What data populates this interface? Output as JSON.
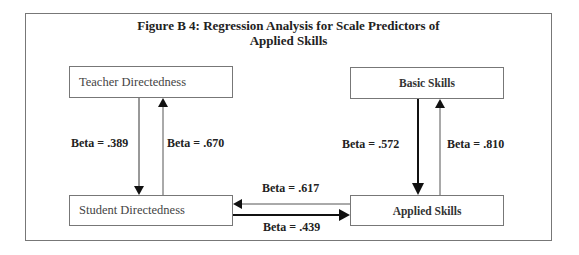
{
  "figure": {
    "title_line1": "Figure B 4:  Regression Analysis for Scale Predictors of",
    "title_line2": "Applied Skills"
  },
  "nodes": {
    "teacher_directedness": "Teacher Directedness",
    "student_directedness": "Student Directedness",
    "basic_skills": "Basic Skills",
    "applied_skills": "Applied Skills"
  },
  "edges": [
    {
      "from": "Teacher Directedness",
      "to": "Student Directedness",
      "label": "Beta = .389"
    },
    {
      "from": "Student Directedness",
      "to": "Teacher Directedness",
      "label": "Beta = .670"
    },
    {
      "from": "Basic Skills",
      "to": "Applied Skills",
      "label": "Beta = .572"
    },
    {
      "from": "Applied Skills",
      "to": "Basic Skills",
      "label": "Beta = .810"
    },
    {
      "from": "Applied Skills",
      "to": "Student Directedness",
      "label": "Beta = .617"
    },
    {
      "from": "Student Directedness",
      "to": "Applied Skills",
      "label": "Beta = .439"
    }
  ],
  "colors": {
    "frame": "#777777",
    "line": "#222222",
    "text": "#222222"
  }
}
